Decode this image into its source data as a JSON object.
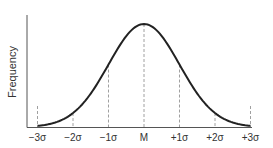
{
  "chart_data": {
    "type": "line",
    "title": "",
    "xlabel": "",
    "ylabel": "Frequency",
    "x_ticks": [
      "−3σ",
      "−2σ",
      "−1σ",
      "M",
      "+1σ",
      "+2σ",
      "+3σ"
    ],
    "x_values": [
      -3,
      -2,
      -1,
      0,
      1,
      2,
      3
    ],
    "dashed_reference_lines": [
      -3,
      -2,
      -1,
      0,
      1,
      2,
      3
    ],
    "grid": false,
    "legend": null,
    "colors": {
      "curve": "#222222",
      "axis": "#555555",
      "dashes": "#888888"
    }
  }
}
